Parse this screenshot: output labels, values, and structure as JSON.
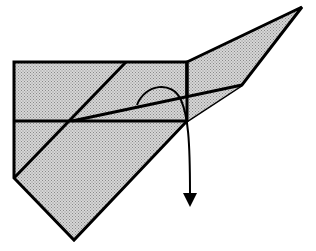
{
  "diagram": {
    "type": "origami-fold-step",
    "description": "Shaded origami model with a flap to be folded down along a crease; curved arrow indicates folding the flap downward behind.",
    "colors": {
      "paper_fill": "#c8c8c8",
      "stroke": "#000000",
      "background": "#ffffff"
    },
    "shapes": {
      "body": [
        [
          14,
          62
        ],
        [
          187,
          62
        ],
        [
          187,
          121
        ],
        [
          74,
          240
        ],
        [
          14,
          178
        ]
      ],
      "wing": [
        [
          187,
          62
        ],
        [
          302,
          7
        ],
        [
          242,
          85
        ],
        [
          187,
          121
        ]
      ],
      "inner_flap": [
        [
          72,
          121
        ],
        [
          242,
          85
        ],
        [
          187,
          121
        ]
      ]
    },
    "lines": {
      "top_edge": [
        [
          14,
          62
        ],
        [
          187,
          62
        ]
      ],
      "horizontal_crease": [
        [
          14,
          121
        ],
        [
          187,
          121
        ]
      ],
      "diagonal_fold": [
        [
          14,
          178
        ],
        [
          126,
          62
        ]
      ],
      "square_right_edge": [
        [
          187,
          62
        ],
        [
          187,
          121
        ]
      ],
      "flap_edge": [
        [
          72,
          121
        ],
        [
          242,
          85
        ]
      ]
    },
    "arrow": {
      "label": "fold-down-arrow",
      "path": "M137,105 C145,84 172,80 181,100 C188,116 190,140 190,193",
      "head": [
        [
          183,
          193
        ],
        [
          197,
          193
        ],
        [
          190,
          207
        ]
      ]
    }
  }
}
